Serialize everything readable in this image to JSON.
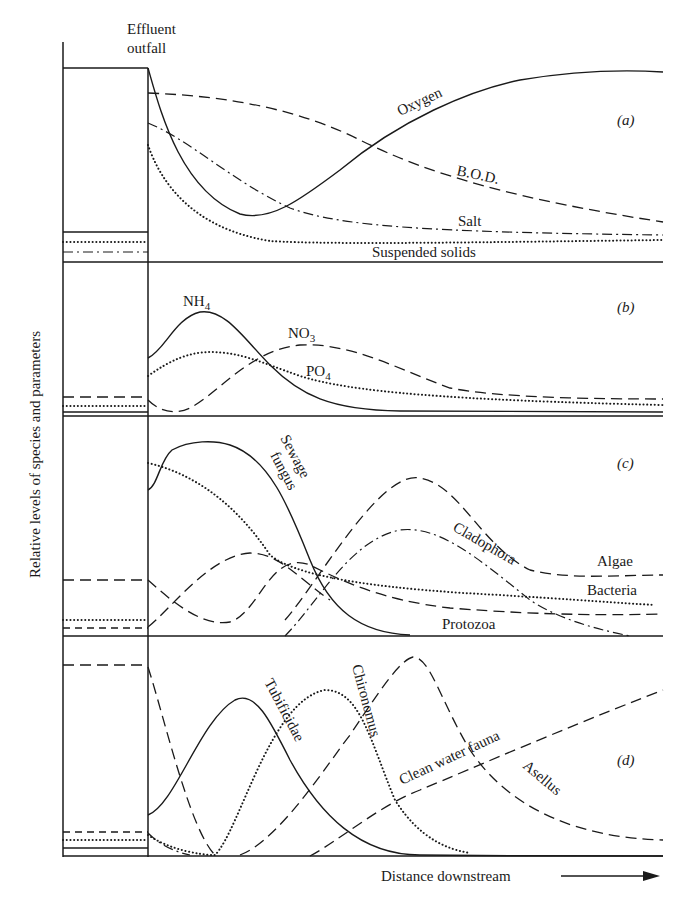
{
  "figure": {
    "outfall_label_line1": "Effluent",
    "outfall_label_line2": "outfall",
    "y_axis_label": "Relative levels of species and parameters",
    "x_axis_label": "Distance downstream",
    "panels": {
      "a": {
        "tag": "(a)",
        "curves": {
          "oxygen": "Oxygen",
          "bod": "B.O.D.",
          "salt": "Salt",
          "suspended_solids": "Suspended solids"
        }
      },
      "b": {
        "tag": "(b)",
        "curves": {
          "nh4": "NH",
          "nh4_sub": "4",
          "no3": "NO",
          "no3_sub": "3",
          "po4": "PO",
          "po4_sub": "4"
        }
      },
      "c": {
        "tag": "(c)",
        "curves": {
          "sewage_fungus_1": "Sewage",
          "sewage_fungus_2": "fungus",
          "cladophora": "Cladophora",
          "algae": "Algae",
          "bacteria": "Bacteria",
          "protozoa": "Protozoa"
        }
      },
      "d": {
        "tag": "(d)",
        "curves": {
          "tubificidae": "Tubificidae",
          "chironomus": "Chironomus",
          "clean_water_fauna": "Clean water fauna",
          "asellus": "Asellus"
        }
      }
    }
  }
}
